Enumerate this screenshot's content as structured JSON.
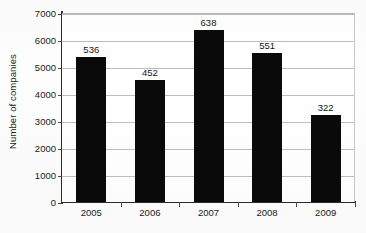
{
  "chart_data": {
    "type": "bar",
    "title": "",
    "xlabel": "",
    "ylabel": "Number of companies",
    "categories": [
      "2005",
      "2006",
      "2007",
      "2008",
      "2009"
    ],
    "values": [
      536,
      452,
      638,
      551,
      322
    ],
    "bar_labels": [
      "536",
      "452",
      "638",
      "551",
      "322"
    ],
    "value_scale_note": "Bars are plotted at 10x the printed data labels",
    "plotted_values": [
      5360,
      4520,
      6380,
      5510,
      3220
    ],
    "ylim": [
      0,
      7000
    ],
    "y_ticks": [
      0,
      1000,
      2000,
      3000,
      4000,
      5000,
      6000,
      7000
    ],
    "y_tick_labels": [
      "0",
      "1000",
      "2000",
      "3000",
      "4000",
      "5000",
      "6000",
      "7000"
    ],
    "grid": true,
    "grid_axis": "y",
    "legend": false,
    "legend_position": "none",
    "bar_color": "#0a0a0a",
    "gridline_color": "#bdbdbd",
    "axis_color": "#2b2b2b",
    "background_color": "#ffffff"
  }
}
